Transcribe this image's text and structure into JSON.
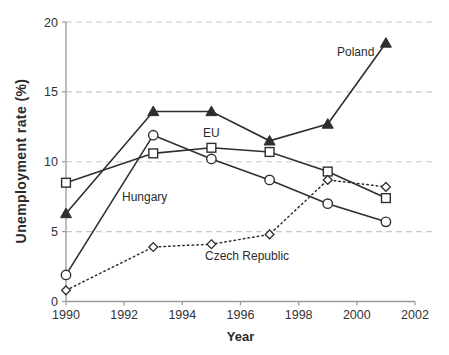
{
  "chart_data": {
    "type": "line",
    "title": "",
    "xlabel": "Year",
    "ylabel": "Unemployment rate (%)",
    "x": [
      1990,
      1993,
      1995,
      1997,
      1999,
      2001
    ],
    "xlim": [
      1990,
      2002
    ],
    "ylim": [
      0,
      20
    ],
    "xticks": [
      1990,
      1992,
      1994,
      1996,
      1998,
      2000,
      2002
    ],
    "yticks": [
      0,
      5,
      10,
      15,
      20
    ],
    "grid": "horizontal dashed lines at 5, 10, 15, 20",
    "legend_position": "inline-labels-on-plot",
    "series": [
      {
        "name": "Poland",
        "marker": "triangle-filled",
        "line": "solid",
        "values": [
          6.3,
          13.6,
          13.6,
          11.5,
          12.7,
          18.5
        ]
      },
      {
        "name": "EU",
        "marker": "square-open",
        "line": "solid",
        "values": [
          8.5,
          10.6,
          11.0,
          10.7,
          9.3,
          7.4
        ]
      },
      {
        "name": "Hungary",
        "marker": "circle-open",
        "line": "solid",
        "values": [
          1.9,
          11.9,
          10.2,
          8.7,
          7.0,
          5.7
        ]
      },
      {
        "name": "Czech Republic",
        "marker": "diamond-open",
        "line": "dotted",
        "values": [
          0.8,
          3.9,
          4.1,
          4.8,
          8.7,
          8.2
        ]
      }
    ],
    "annotations": [
      {
        "text": "Poland",
        "x": 337,
        "y": 45
      },
      {
        "text": "EU",
        "x": 203,
        "y": 126
      },
      {
        "text": "Hungary",
        "x": 122,
        "y": 190
      },
      {
        "text": "Czech Republic",
        "x": 205,
        "y": 249
      }
    ]
  },
  "colors": {
    "background": "#ffffff",
    "data_line": "#2f2f2f",
    "axis": "#9a9a9a",
    "grid": "#c8c8c8",
    "tick_text": "#333333",
    "marker_fill_open": "#ffffff"
  }
}
